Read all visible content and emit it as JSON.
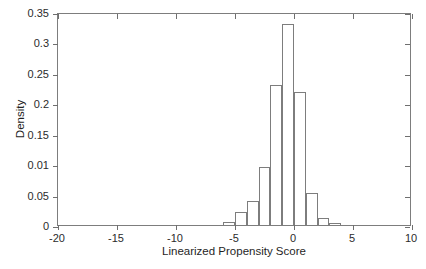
{
  "chart_data": {
    "type": "bar",
    "title": "",
    "xlabel": "Linearized Propensity Score",
    "ylabel": "Density",
    "xlim": [
      -20,
      10
    ],
    "ylim": [
      0,
      0.35
    ],
    "grid": false,
    "legend": null,
    "bin_width": 1,
    "xticks": [
      -20,
      -15,
      -10,
      -5,
      0,
      5,
      10
    ],
    "xtick_labels": [
      "-20",
      "-15",
      "-10",
      "-5",
      "0",
      "5",
      "10"
    ],
    "yticks": [
      0,
      0.05,
      0.1,
      0.15,
      0.2,
      0.25,
      0.3,
      0.35
    ],
    "ytick_labels": [
      "0",
      "0.05",
      "0.01",
      "0.15",
      "0.2",
      "0.25",
      "0.3",
      "0.35"
    ],
    "bin_edges": [
      -6,
      -5,
      -4,
      -3,
      -2,
      -1,
      0,
      1,
      2,
      3,
      4
    ],
    "bin_centers": [
      -5.5,
      -4.5,
      -3.5,
      -2.5,
      -1.5,
      -0.5,
      0.5,
      1.5,
      2.5,
      3.5
    ],
    "values": [
      0.005,
      0.022,
      0.039,
      0.095,
      0.23,
      0.331,
      0.218,
      0.052,
      0.012,
      0.003
    ],
    "bars": [
      {
        "x0": -6,
        "x1": -5,
        "height": 0.005
      },
      {
        "x0": -5,
        "x1": -4,
        "height": 0.022
      },
      {
        "x0": -4,
        "x1": -3,
        "height": 0.039
      },
      {
        "x0": -3,
        "x1": -2,
        "height": 0.095
      },
      {
        "x0": -2,
        "x1": -1,
        "height": 0.23
      },
      {
        "x0": -1,
        "x1": 0,
        "height": 0.331
      },
      {
        "x0": 0,
        "x1": 1,
        "height": 0.218
      },
      {
        "x0": 1,
        "x1": 2,
        "height": 0.052
      },
      {
        "x0": 2,
        "x1": 3,
        "height": 0.012
      },
      {
        "x0": 3,
        "x1": 4,
        "height": 0.003
      }
    ],
    "colors": {
      "bar_edge": "#7d7d7d",
      "bar_fill": "transparent",
      "axis": "#7d7d7d",
      "text": "#1f1f1f",
      "background": "#ffffff"
    }
  }
}
